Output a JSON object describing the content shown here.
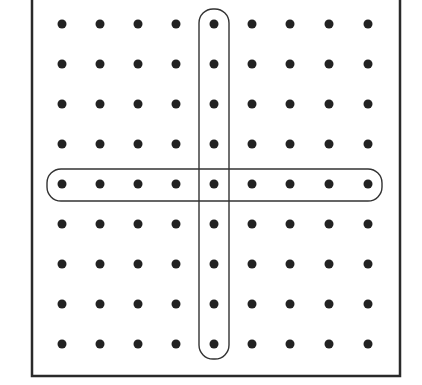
{
  "figure": {
    "rows": 9,
    "cols": 9,
    "dot_x": [
      62,
      100,
      138,
      176,
      214,
      252,
      290,
      329,
      368
    ],
    "dot_y": [
      24,
      64,
      104,
      144,
      184,
      224,
      264,
      304,
      344
    ],
    "dot_radius": 4.5,
    "dot_color": "#222222",
    "frame": {
      "left": 32,
      "right": 400,
      "top": -2,
      "bottom": 376,
      "stroke": "#2a2a2a",
      "stroke_width": 2.5,
      "top_edge_visible": false
    },
    "highlights": [
      {
        "name": "column-5-outline",
        "orientation": "vertical",
        "column_index": 4,
        "x": 199,
        "y": 9,
        "width": 30,
        "height": 350,
        "corner_radius": 14,
        "stroke": "#333333",
        "stroke_width": 1.4
      },
      {
        "name": "row-5-outline",
        "orientation": "horizontal",
        "row_index": 4,
        "x": 47,
        "y": 169,
        "width": 335,
        "height": 32,
        "corner_radius": 14,
        "stroke": "#333333",
        "stroke_width": 1.4
      }
    ]
  }
}
